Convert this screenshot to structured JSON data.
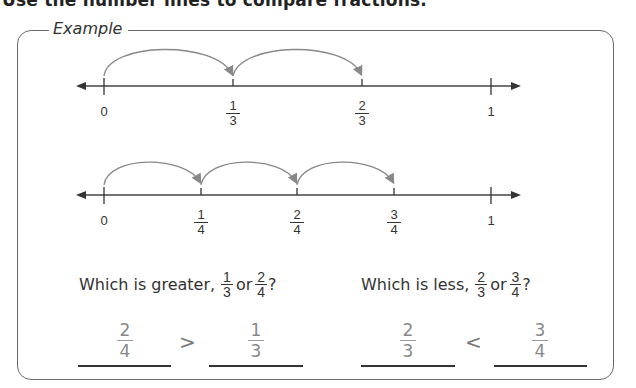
{
  "page": {
    "title": "Use the number lines to compare fractions."
  },
  "example": {
    "label": "Example",
    "number_line_thirds": {
      "ticks": [
        {
          "label": "0"
        },
        {
          "numerator": "1",
          "denominator": "3"
        },
        {
          "numerator": "2",
          "denominator": "3"
        },
        {
          "label": "1"
        }
      ],
      "jumps": 2
    },
    "number_line_fourths": {
      "ticks": [
        {
          "label": "0"
        },
        {
          "numerator": "1",
          "denominator": "4"
        },
        {
          "numerator": "2",
          "denominator": "4"
        },
        {
          "numerator": "3",
          "denominator": "4"
        },
        {
          "label": "1"
        }
      ],
      "jumps": 3
    },
    "questions": [
      {
        "prefix": "Which is greater,",
        "frac_a": {
          "numerator": "1",
          "denominator": "3"
        },
        "connector": "or",
        "frac_b": {
          "numerator": "2",
          "denominator": "4"
        },
        "suffix": "?",
        "answer_left": {
          "numerator": "2",
          "denominator": "4"
        },
        "symbol": ">",
        "answer_right": {
          "numerator": "1",
          "denominator": "3"
        }
      },
      {
        "prefix": "Which is less,",
        "frac_a": {
          "numerator": "2",
          "denominator": "3"
        },
        "connector": "or",
        "frac_b": {
          "numerator": "3",
          "denominator": "4"
        },
        "suffix": "?",
        "answer_left": {
          "numerator": "2",
          "denominator": "3"
        },
        "symbol": "<",
        "answer_right": {
          "numerator": "3",
          "denominator": "4"
        }
      }
    ]
  }
}
